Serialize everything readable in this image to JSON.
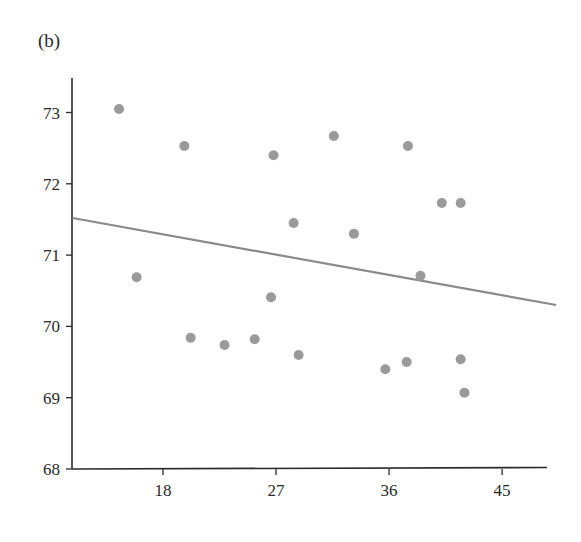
{
  "panel_label": "(b)",
  "colors": {
    "axis": "#2a2a2a",
    "points": "#9a9a9a",
    "fit_line": "#8a8a8a"
  },
  "chart_data": {
    "type": "scatter",
    "title": "(b)",
    "xlabel": "",
    "ylabel": "",
    "xlim": [
      10.8,
      49.3
    ],
    "ylim": [
      68,
      73.5
    ],
    "x_ticks": [
      18,
      27,
      36,
      45
    ],
    "y_ticks": [
      68,
      69,
      70,
      71,
      72,
      73
    ],
    "grid": false,
    "legend": null,
    "series": [
      {
        "name": "observations",
        "kind": "points",
        "points": [
          {
            "x": 14.5,
            "y": 73.05
          },
          {
            "x": 19.7,
            "y": 72.53
          },
          {
            "x": 26.8,
            "y": 72.4
          },
          {
            "x": 31.6,
            "y": 72.67
          },
          {
            "x": 37.5,
            "y": 72.53
          },
          {
            "x": 40.2,
            "y": 71.73
          },
          {
            "x": 41.7,
            "y": 71.73
          },
          {
            "x": 28.4,
            "y": 71.45
          },
          {
            "x": 33.2,
            "y": 71.3
          },
          {
            "x": 15.9,
            "y": 70.69
          },
          {
            "x": 38.5,
            "y": 70.71
          },
          {
            "x": 26.6,
            "y": 70.41
          },
          {
            "x": 20.2,
            "y": 69.84
          },
          {
            "x": 22.9,
            "y": 69.74
          },
          {
            "x": 25.3,
            "y": 69.82
          },
          {
            "x": 28.8,
            "y": 69.6
          },
          {
            "x": 35.7,
            "y": 69.4
          },
          {
            "x": 37.4,
            "y": 69.5
          },
          {
            "x": 41.7,
            "y": 69.54
          },
          {
            "x": 42.0,
            "y": 69.07
          }
        ]
      },
      {
        "name": "regression line",
        "kind": "line",
        "points": [
          {
            "x": 10.8,
            "y": 71.52
          },
          {
            "x": 49.3,
            "y": 70.3
          }
        ]
      }
    ]
  }
}
